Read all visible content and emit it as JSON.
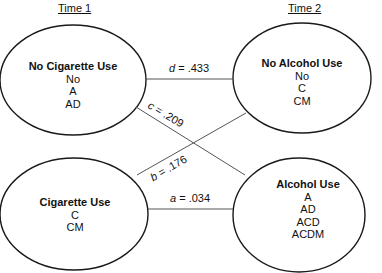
{
  "headers": {
    "time1": "Time 1",
    "time2": "Time 2"
  },
  "nodes": {
    "no_cig": {
      "title": "No Cigarette Use",
      "items": [
        "No",
        "A",
        "AD"
      ]
    },
    "cig": {
      "title": "Cigarette Use",
      "items": [
        "C",
        "CM"
      ]
    },
    "no_alc": {
      "title": "No Alcohol Use",
      "items": [
        "No",
        "C",
        "CM"
      ]
    },
    "alc": {
      "title": "Alcohol Use",
      "items": [
        "A",
        "AD",
        "ACD",
        "ACDM"
      ]
    }
  },
  "edges": {
    "d": {
      "letter": "d",
      "value": " = .433",
      "from": "No Cigarette Use",
      "to": "No Alcohol Use"
    },
    "c": {
      "letter": "c",
      "value": " = .209",
      "from": "No Cigarette Use",
      "to": "Alcohol Use"
    },
    "b": {
      "letter": "b",
      "value": " = .176",
      "from": "Cigarette Use",
      "to": "No Alcohol Use"
    },
    "a": {
      "letter": "a",
      "value": " = .034",
      "from": "Cigarette Use",
      "to": "Alcohol Use"
    }
  },
  "colors": {
    "stroke": "#1a1a1a",
    "line": "#555555"
  }
}
